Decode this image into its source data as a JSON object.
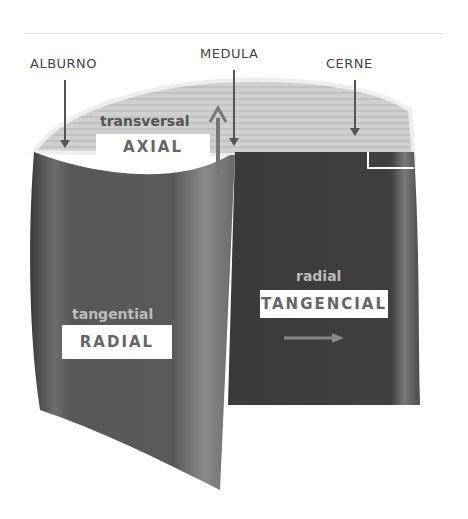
{
  "labels": {
    "alburno": "ALBURNO",
    "medula": "MEDULA",
    "cerne": "CERNE",
    "transversal": "transversal",
    "axial": "AXIAL",
    "tangential": "tangential",
    "radial_box": "RADIAL",
    "radial_small": "radial",
    "tangencial": "TANGENCIAL"
  },
  "colors": {
    "background": "#ffffff",
    "dark_wood": "#3a3a3a",
    "mid_wood": "#6a6a6a",
    "light_wood": "#c8c8c8"
  }
}
